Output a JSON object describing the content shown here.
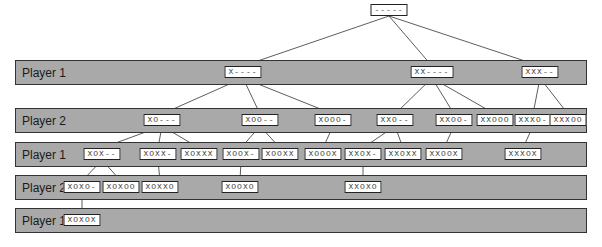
{
  "bands": [
    {
      "label": "Player 1"
    },
    {
      "label": "Player 2"
    },
    {
      "label": "Player 1"
    },
    {
      "label": "Player 2"
    },
    {
      "label": "Player 1"
    }
  ],
  "nodes": [
    {
      "id": "r",
      "level": 0,
      "label": "-----"
    },
    {
      "id": "x",
      "level": 1,
      "label": "X----",
      "parent": "r"
    },
    {
      "id": "xx",
      "level": 1,
      "label": "XX----",
      "parent": "r"
    },
    {
      "id": "xxx",
      "level": 1,
      "label": "XXX--",
      "parent": "r"
    },
    {
      "id": "xo",
      "level": 2,
      "label": "XO---",
      "parent": "x"
    },
    {
      "id": "xoo",
      "level": 2,
      "label": "XOO--",
      "parent": "x"
    },
    {
      "id": "xooo",
      "level": 2,
      "label": "XOOO-",
      "parent": "x"
    },
    {
      "id": "xxo",
      "level": 2,
      "label": "XXO--",
      "parent": "xx"
    },
    {
      "id": "xxoo",
      "level": 2,
      "label": "XXOO-",
      "parent": "xx"
    },
    {
      "id": "xxooo",
      "level": 2,
      "label": "XXOOO",
      "parent": "xx"
    },
    {
      "id": "xxxo",
      "level": 2,
      "label": "XXXO-",
      "parent": "xxx"
    },
    {
      "id": "xxxoo",
      "level": 2,
      "label": "XXXOO",
      "parent": "xxx"
    },
    {
      "id": "xox",
      "level": 3,
      "label": "XOX--",
      "parent": "xo"
    },
    {
      "id": "xoxx",
      "level": 3,
      "label": "XOXX-",
      "parent": "xo"
    },
    {
      "id": "xoxxx",
      "level": 3,
      "label": "XOXXX",
      "parent": "xo"
    },
    {
      "id": "xoox",
      "level": 3,
      "label": "XOOX-",
      "parent": "xoo"
    },
    {
      "id": "xooxx",
      "level": 3,
      "label": "XOOXX",
      "parent": "xoo"
    },
    {
      "id": "xooox",
      "level": 3,
      "label": "XOOOX",
      "parent": "xooo"
    },
    {
      "id": "xxox",
      "level": 3,
      "label": "XXOX-",
      "parent": "xxo"
    },
    {
      "id": "xxoxx",
      "level": 3,
      "label": "XXOXX",
      "parent": "xxo"
    },
    {
      "id": "xxoox",
      "level": 3,
      "label": "XXOOX",
      "parent": "xxoo"
    },
    {
      "id": "xxxox",
      "level": 3,
      "label": "XXXOX",
      "parent": "xxxo"
    },
    {
      "id": "xoxo",
      "level": 4,
      "label": "XOXO-",
      "parent": "xox"
    },
    {
      "id": "xoxoo",
      "level": 4,
      "label": "XOXOO",
      "parent": "xox"
    },
    {
      "id": "xoxxo",
      "level": 4,
      "label": "XOXXO",
      "parent": "xoxx"
    },
    {
      "id": "xooxo",
      "level": 4,
      "label": "XOOXO",
      "parent": "xoox"
    },
    {
      "id": "xxoxo",
      "level": 4,
      "label": "XXOXO",
      "parent": "xxox"
    },
    {
      "id": "xoxox",
      "level": 5,
      "label": "XOXOX",
      "parent": "xoxo"
    }
  ]
}
